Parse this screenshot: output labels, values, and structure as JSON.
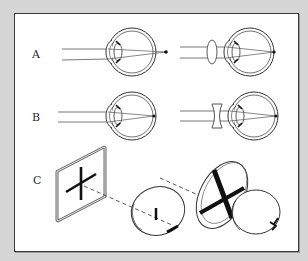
{
  "figure": {
    "panels": [
      {
        "label": "A",
        "description": "hyperopia: focus behind retina; corrected with convex lens"
      },
      {
        "label": "B",
        "description": "myopia: focus in front of retina; corrected with concave lens"
      },
      {
        "label": "C",
        "description": "astigmatism: cross target viewed through eye with irregular cornea"
      }
    ],
    "colors": {
      "background": "#d6d6d6",
      "panel": "#ffffff",
      "border": "#3a3a3a",
      "ink": "#2a2a2a"
    }
  }
}
